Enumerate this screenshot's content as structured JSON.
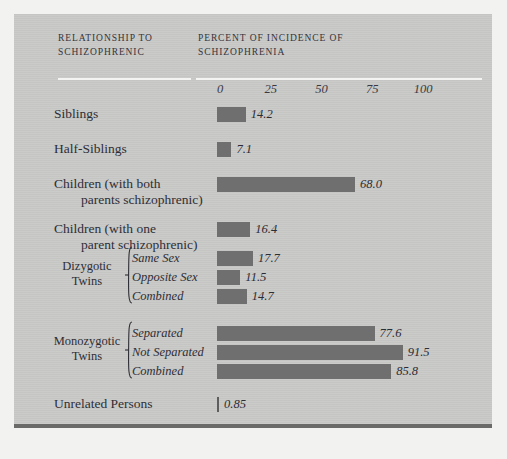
{
  "figure": {
    "header_left": "RELATIONSHIP TO\nSCHIZOPHRENIC",
    "header_right": "PERCENT OF INCIDENCE\nOF SCHIZOPHRENIA",
    "bar_color": "#6f6f6f",
    "panel_color": "#c9c9c7",
    "rule_color": "#f4f4f2",
    "text_color": "#2e2e36"
  },
  "chart_data": {
    "type": "bar",
    "orientation": "horizontal",
    "title": "PERCENT OF INCIDENCE OF SCHIZOPHRENIA",
    "xlabel": "PERCENT OF INCIDENCE OF SCHIZOPHRENIA",
    "ylabel": "RELATIONSHIP TO SCHIZOPHRENIC",
    "xlim": [
      0,
      100
    ],
    "xticks": [
      0,
      25,
      50,
      75,
      100
    ],
    "xtick_labels": [
      "0",
      "25",
      "50",
      "75",
      "100"
    ],
    "grid": false,
    "legend": null,
    "categories": [
      "Siblings",
      "Half-Siblings",
      "Children (with both parents schizophrenic)",
      "Children (with one parent schizophrenic)",
      "Dizygotic Twins — Same Sex",
      "Dizygotic Twins — Opposite Sex",
      "Dizygotic Twins — Combined",
      "Monozygotic Twins — Separated",
      "Monozygotic Twins — Not Separated",
      "Monozygotic Twins — Combined",
      "Unrelated Persons"
    ],
    "values": [
      14.2,
      7.1,
      68.0,
      16.4,
      17.7,
      11.5,
      14.7,
      77.6,
      91.5,
      85.8,
      0.85
    ]
  },
  "axis": {
    "ticks": [
      {
        "label": "0",
        "value": 0
      },
      {
        "label": "25",
        "value": 25
      },
      {
        "label": "50",
        "value": 50
      },
      {
        "label": "75",
        "value": 75
      },
      {
        "label": "100",
        "value": 100
      }
    ]
  },
  "rows": [
    {
      "label": "Siblings",
      "value": 14.2,
      "value_text": "14.2",
      "top": 92
    },
    {
      "label": "Half-Siblings",
      "value": 7.1,
      "value_text": "7.1",
      "top": 127
    },
    {
      "label": "Children (with both\n  parents schizophrenic)",
      "value": 68.0,
      "value_text": "68.0",
      "top": 162
    },
    {
      "label": "Children (with one\n  parent schizophrenic)",
      "value": 16.4,
      "value_text": "16.4",
      "top": 207
    }
  ],
  "groups": [
    {
      "name": "Dizygotic\nTwins",
      "label_top": 245,
      "brace_top": 232,
      "brace_height": 58,
      "items": [
        {
          "label": "Same Sex",
          "value": 17.7,
          "value_text": "17.7",
          "top": 236
        },
        {
          "label": "Opposite Sex",
          "value": 11.5,
          "value_text": "11.5",
          "top": 255
        },
        {
          "label": "Combined",
          "value": 14.7,
          "value_text": "14.7",
          "top": 274
        }
      ]
    },
    {
      "name": "Monozygotic\nTwins",
      "label_top": 320,
      "brace_top": 307,
      "brace_height": 58,
      "items": [
        {
          "label": "Separated",
          "value": 77.6,
          "value_text": "77.6",
          "top": 311
        },
        {
          "label": "Not Separated",
          "value": 91.5,
          "value_text": "91.5",
          "top": 330
        },
        {
          "label": "Combined",
          "value": 85.8,
          "value_text": "85.8",
          "top": 349
        }
      ]
    }
  ],
  "footer_rows": [
    {
      "label": "Unrelated Persons",
      "value": 0.85,
      "value_text": "0.85",
      "top": 382
    }
  ]
}
